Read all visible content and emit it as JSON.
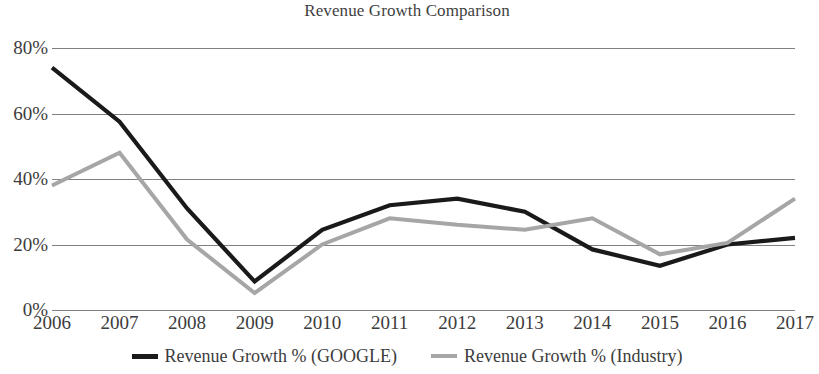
{
  "chart_data": {
    "type": "line",
    "title": "Revenue Growth Comparison",
    "xlabel": "",
    "ylabel": "",
    "categories": [
      "2006",
      "2007",
      "2008",
      "2009",
      "2010",
      "2011",
      "2012",
      "2013",
      "2014",
      "2015",
      "2016",
      "2017"
    ],
    "series": [
      {
        "name": "Revenue Growth % (GOOGLE)",
        "color": "#1a1a1a",
        "values": [
          74,
          57.5,
          31,
          8.7,
          24.5,
          32,
          34,
          30,
          18.5,
          13.5,
          20,
          22
        ]
      },
      {
        "name": "Revenue Growth % (Industry)",
        "color": "#a6a6a6",
        "values": [
          38,
          48,
          21.5,
          5.2,
          20,
          28,
          26,
          24.5,
          28,
          17,
          20.5,
          34
        ]
      }
    ],
    "ylim": [
      0,
      80
    ],
    "yticks": [
      0,
      20,
      40,
      60,
      80
    ],
    "ytick_labels": [
      "0%",
      "20%",
      "40%",
      "60%",
      "80%"
    ],
    "grid": true,
    "gridline_color": "#808080",
    "legend_position": "bottom",
    "legend": [
      {
        "label": "Revenue Growth % (GOOGLE)",
        "color": "#1a1a1a"
      },
      {
        "label": "Revenue Growth % (Industry)",
        "color": "#a6a6a6"
      }
    ]
  }
}
